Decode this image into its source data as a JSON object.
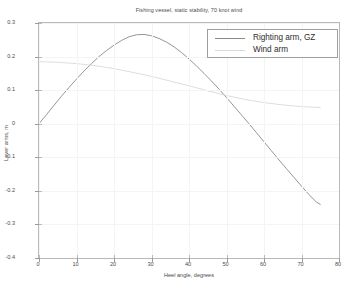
{
  "chart_data": {
    "type": "line",
    "title": "Fishing vessel, static stability, 70 knot wind",
    "xlabel": "Heel angle, degrees",
    "ylabel": "Lever arms, m",
    "xlim": [
      0,
      80
    ],
    "ylim": [
      -0.4,
      0.3
    ],
    "xticks": [
      "0",
      "10",
      "20",
      "30",
      "40",
      "50",
      "60",
      "70",
      "80"
    ],
    "yticks": [
      "0.3",
      "0.2",
      "0.1",
      "0",
      "-0.1",
      "-0.2",
      "-0.3",
      "-0.4"
    ],
    "grid": true,
    "legend_position": "top-right",
    "series": [
      {
        "name": "Righting arm, GZ",
        "color": "#8a8a8a",
        "x": [
          0,
          2,
          4,
          6,
          8,
          10,
          12,
          14,
          16,
          18,
          20,
          22,
          24,
          26,
          28,
          30,
          32,
          34,
          36,
          38,
          40,
          42,
          44,
          46,
          48,
          50,
          52,
          54,
          56,
          58,
          60,
          62,
          64,
          66,
          68,
          70,
          72,
          74,
          75
        ],
        "y": [
          0.0,
          0.027,
          0.055,
          0.082,
          0.108,
          0.133,
          0.157,
          0.179,
          0.2,
          0.218,
          0.234,
          0.248,
          0.259,
          0.265,
          0.266,
          0.262,
          0.254,
          0.243,
          0.229,
          0.212,
          0.193,
          0.172,
          0.15,
          0.127,
          0.103,
          0.078,
          0.052,
          0.026,
          0.0,
          -0.027,
          -0.054,
          -0.081,
          -0.108,
          -0.134,
          -0.16,
          -0.186,
          -0.211,
          -0.234,
          -0.24
        ]
      },
      {
        "name": "Wind arm",
        "color": "#d4d4d4",
        "x": [
          0,
          5,
          10,
          15,
          20,
          25,
          30,
          35,
          40,
          45,
          50,
          55,
          60,
          65,
          70,
          75
        ],
        "y": [
          0.185,
          0.183,
          0.179,
          0.173,
          0.164,
          0.153,
          0.141,
          0.127,
          0.113,
          0.098,
          0.084,
          0.072,
          0.063,
          0.056,
          0.051,
          0.048
        ]
      }
    ]
  },
  "legend": {
    "items": [
      {
        "label": "Righting arm, GZ",
        "swatch_color": "#8a8a8a"
      },
      {
        "label": "Wind arm",
        "swatch_color": "#d9d9d9"
      }
    ]
  }
}
